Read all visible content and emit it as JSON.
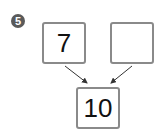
{
  "problem": {
    "number_label": "5"
  },
  "number_bond": {
    "part_left": "7",
    "part_right": "",
    "whole": "10"
  },
  "colors": {
    "box_border": "#8a8a8a",
    "badge_fill": "#5a5a5a",
    "arrow": "#333333"
  }
}
